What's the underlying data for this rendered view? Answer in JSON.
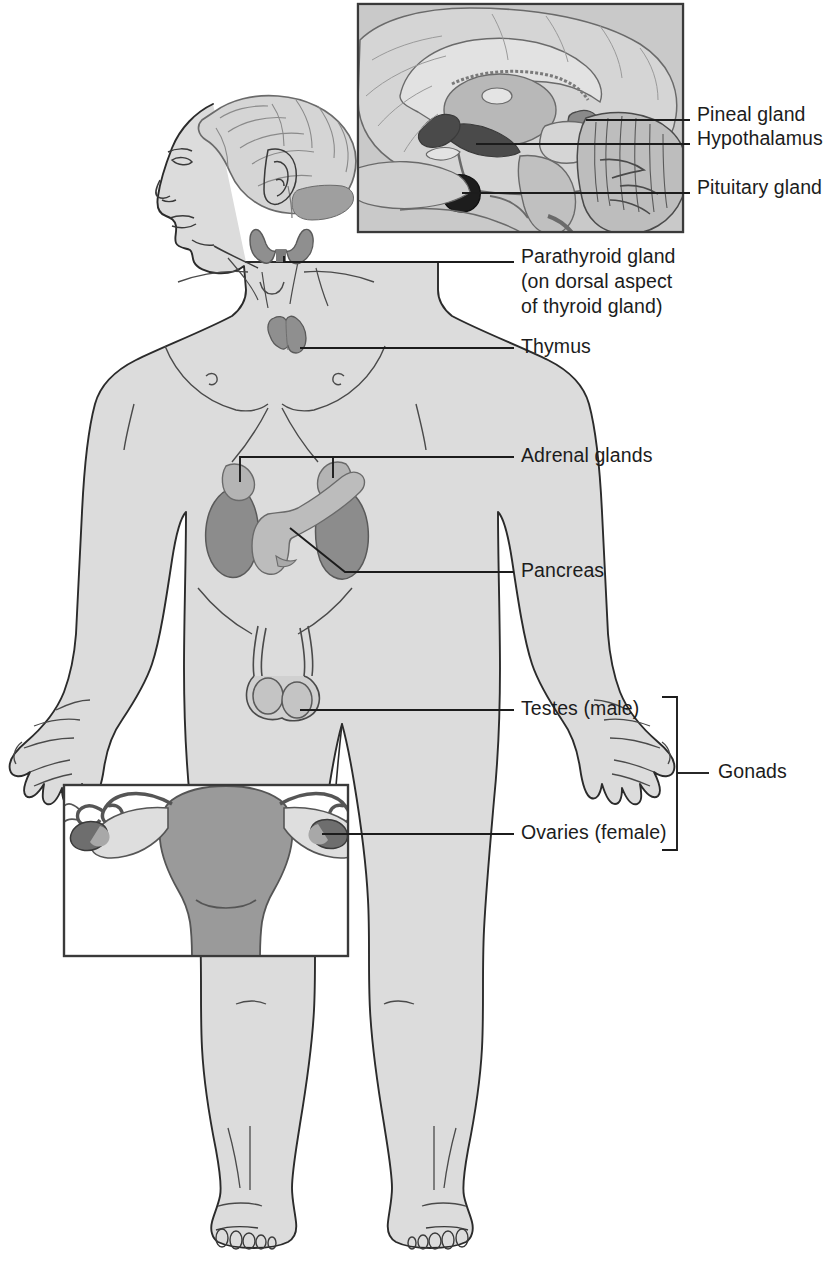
{
  "colors": {
    "background": "#ffffff",
    "body_fill": "#dcdcdc",
    "body_outline": "#2b2b2b",
    "inset_bg": "#c9c9c9",
    "inset_border": "#3a3a3a",
    "brain_light": "#d5d5d5",
    "brain_mid": "#b8b8b8",
    "hypothalamus": "#4a4a4a",
    "pituitary": "#1d1d1d",
    "pineal": "#8a8a8a",
    "thyroid": "#8f8f8f",
    "thymus": "#8f8f8f",
    "kidney": "#8c8c8c",
    "adrenal": "#b4b4b4",
    "pancreas": "#bcbcbc",
    "testis": "#c4c4c4",
    "uterus": "#9a9a9a",
    "ovary_dark": "#6e6e6e",
    "leader_line": "#1c1c1c",
    "label_text": "#1c1c1c"
  },
  "labels": [
    {
      "id": "pineal",
      "text": "Pineal gland",
      "x": 697,
      "y": 102
    },
    {
      "id": "hypothalamus",
      "text": "Hypothalamus",
      "x": 697,
      "y": 136
    },
    {
      "id": "pituitary",
      "text": "Pituitary gland",
      "x": 697,
      "y": 170
    },
    {
      "id": "parathyroid",
      "text": "Parathyroid gland",
      "x": 521,
      "y": 248
    },
    {
      "id": "parathyroid_sub1",
      "text": "(on dorsal aspect",
      "x": 521,
      "y": 273
    },
    {
      "id": "parathyroid_sub2",
      "text": "of thyroid gland)",
      "x": 521,
      "y": 298
    },
    {
      "id": "thymus",
      "text": "Thymus",
      "x": 521,
      "y": 337
    },
    {
      "id": "adrenal",
      "text": "Adrenal glands",
      "x": 521,
      "y": 444
    },
    {
      "id": "pancreas",
      "text": "Pancreas",
      "x": 521,
      "y": 532
    },
    {
      "id": "testes",
      "text": "Testes (male)",
      "x": 521,
      "y": 700
    },
    {
      "id": "ovaries",
      "text": "Ovaries (female)",
      "x": 521,
      "y": 824
    },
    {
      "id": "gonads",
      "text": "Gonads",
      "x": 718,
      "y": 762
    }
  ],
  "glands": [
    {
      "id": "pineal-gland",
      "name": "Pineal gland",
      "location": "brain inset, posterior to third ventricle"
    },
    {
      "id": "hypothalamus",
      "name": "Hypothalamus",
      "location": "brain inset, floor of third ventricle"
    },
    {
      "id": "pituitary-gland",
      "name": "Pituitary gland",
      "location": "brain inset, sella turcica"
    },
    {
      "id": "parathyroid-gland",
      "name": "Parathyroid gland",
      "location": "on dorsal aspect of thyroid gland, neck"
    },
    {
      "id": "thymus",
      "name": "Thymus",
      "location": "superior mediastinum, upper chest"
    },
    {
      "id": "adrenal-glands",
      "name": "Adrenal glands",
      "location": "superior pole of each kidney"
    },
    {
      "id": "pancreas",
      "name": "Pancreas",
      "location": "posterior abdomen between kidneys"
    },
    {
      "id": "testes",
      "name": "Testes (male)",
      "location": "scrotum"
    },
    {
      "id": "ovaries",
      "name": "Ovaries (female)",
      "location": "pelvis, lateral to uterus"
    }
  ],
  "brackets": {
    "gonads_label": "Gonads",
    "gonads_members": [
      "Testes (male)",
      "Ovaries (female)"
    ]
  },
  "insets": [
    {
      "id": "brain-inset",
      "description": "midsagittal section of the brain showing pineal gland, hypothalamus and pituitary gland",
      "x": 357,
      "y": 3,
      "width": 327,
      "height": 230
    },
    {
      "id": "uterus-inset",
      "description": "anterior view of uterus, fallopian tubes and ovaries",
      "x": 63,
      "y": 784,
      "width": 286,
      "height": 173
    }
  ]
}
